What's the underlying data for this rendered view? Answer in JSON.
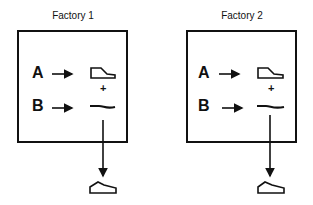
{
  "factories": [
    {
      "title": "Factory 1",
      "inputs": [
        "A",
        "B"
      ],
      "components": [
        "shoe-upper",
        "shoe-sole"
      ],
      "output": "shoe"
    },
    {
      "title": "Factory 2",
      "inputs": [
        "A",
        "B"
      ],
      "components": [
        "shoe-upper",
        "shoe-sole"
      ],
      "output": "shoe"
    }
  ],
  "symbols": {
    "plus": "+"
  }
}
